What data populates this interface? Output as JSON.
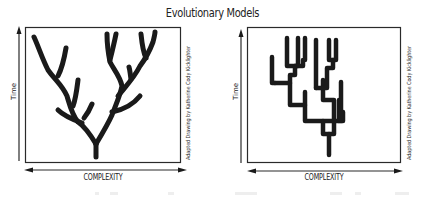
{
  "title": "Evolutionary Models",
  "panels": [
    {
      "id": "branching-tree",
      "y_axis_label": "Time",
      "x_axis_label": "COMPLEXITY",
      "credit": "Adapted Drawing by Katherine Cody Kicklighter",
      "x_axis_double_headed": true,
      "y_axis_arrow_up": true,
      "description": "Dichotomously branching tree spreading wide at top"
    },
    {
      "id": "candelabra",
      "y_axis_label": "Time",
      "x_axis_label": "COMPLEXITY",
      "credit": "Adapted Drawing by Katherine Cody Kicklighter",
      "x_axis_double_headed": true,
      "y_axis_arrow_up": true,
      "description": "Right-angled candelabra-like branching structure"
    }
  ],
  "colors": {
    "ink": "#1a1a1a",
    "frame": "#2a2a2a",
    "background": "#ffffff"
  }
}
